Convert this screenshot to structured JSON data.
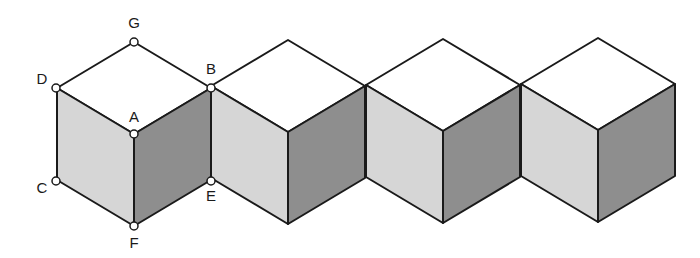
{
  "diagram": {
    "colors": {
      "top_face": "#ffffff",
      "left_face": "#d6d6d6",
      "right_face": "#8e8e8e",
      "edge": "#1a1a1a"
    },
    "cubes": [
      {
        "cx": 134,
        "top_y": 42
      },
      {
        "cx": 288,
        "top_y": 40
      },
      {
        "cx": 443,
        "top_y": 39
      },
      {
        "cx": 598,
        "top_y": 38
      }
    ],
    "points": [
      {
        "label": "G",
        "x": 134,
        "y": 42
      },
      {
        "label": "D",
        "x": 56,
        "y": 88
      },
      {
        "label": "B",
        "x": 211,
        "y": 88
      },
      {
        "label": "A",
        "x": 134,
        "y": 134
      },
      {
        "label": "C",
        "x": 56,
        "y": 181
      },
      {
        "label": "E",
        "x": 211,
        "y": 181
      },
      {
        "label": "F",
        "x": 134,
        "y": 226
      }
    ]
  }
}
